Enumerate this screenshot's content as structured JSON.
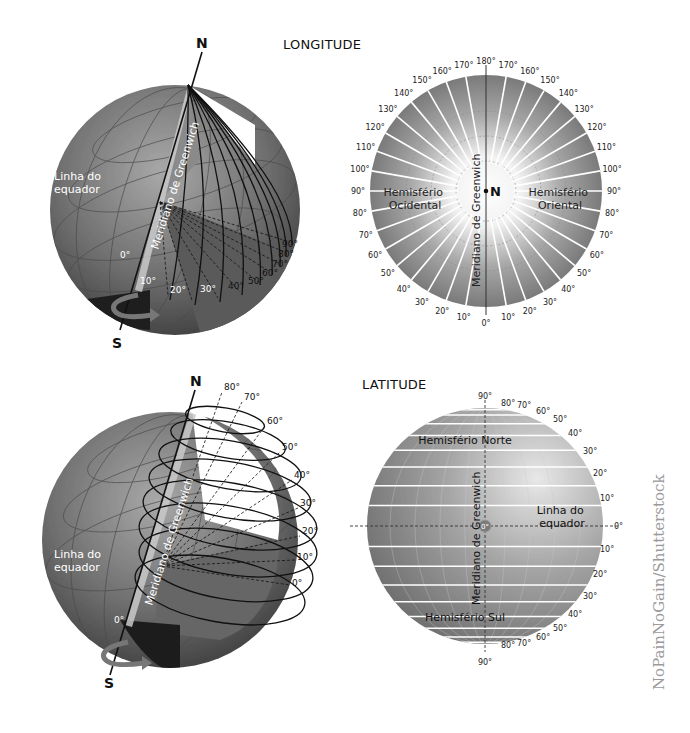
{
  "longitude": {
    "title": "LONGITUDE",
    "globe": {
      "north_label": "N",
      "south_label": "S",
      "equator_label_line1": "Linha do",
      "equator_label_line2": "equador",
      "meridian_label": "Meridiano de Greenwich",
      "zero_label": "0°",
      "degree_labels": [
        "10°",
        "20°",
        "30°",
        "40°",
        "50°",
        "60°",
        "70°",
        "80°",
        "90°"
      ]
    },
    "polar": {
      "center_label": "N",
      "meridian_label": "Meridiano de Greenwich",
      "west_line1": "Hemisfério",
      "west_line2": "Ocidental",
      "east_line1": "Hemisfério",
      "east_line2": "Oriental",
      "top_label": "180°",
      "bottom_label": "0°",
      "left_labels": [
        "170°",
        "160°",
        "150°",
        "140°",
        "130°",
        "120°",
        "110°",
        "100°",
        "90°",
        "80°",
        "70°",
        "60°",
        "50°",
        "40°",
        "30°",
        "20°",
        "10°"
      ],
      "right_labels": [
        "170°",
        "160°",
        "150°",
        "140°",
        "130°",
        "120°",
        "110°",
        "100°",
        "90°",
        "80°",
        "70°",
        "60°",
        "50°",
        "40°",
        "30°",
        "20°",
        "10°"
      ]
    }
  },
  "latitude": {
    "title": "LATITUDE",
    "globe": {
      "north_label": "N",
      "south_label": "S",
      "equator_label_line1": "Linha do",
      "equator_label_line2": "equador",
      "meridian_label": "Meridiano de Greenwich",
      "zero_label": "0°",
      "degree_labels": [
        "80°",
        "70°",
        "60°",
        "50°",
        "40°",
        "30°",
        "20°",
        "10°",
        "0°"
      ]
    },
    "front": {
      "north_hemisphere": "Hemisfério Norte",
      "south_hemisphere": "Hemisfério Sul",
      "meridian_label": "Meridiano de Greenwich",
      "equator_line1": "Linha do",
      "equator_line2": "equador",
      "center_label": "0°",
      "top_label": "90°",
      "bottom_label": "90°",
      "equator_right_label": "0°",
      "north_labels": [
        "80°",
        "70°",
        "60°",
        "50°",
        "40°",
        "30°",
        "20°",
        "10°"
      ],
      "south_labels": [
        "10°",
        "20°",
        "30°",
        "40°",
        "50°",
        "60°",
        "70°",
        "80°"
      ]
    }
  },
  "credit": "NoPainNoGain/Shutterstock"
}
